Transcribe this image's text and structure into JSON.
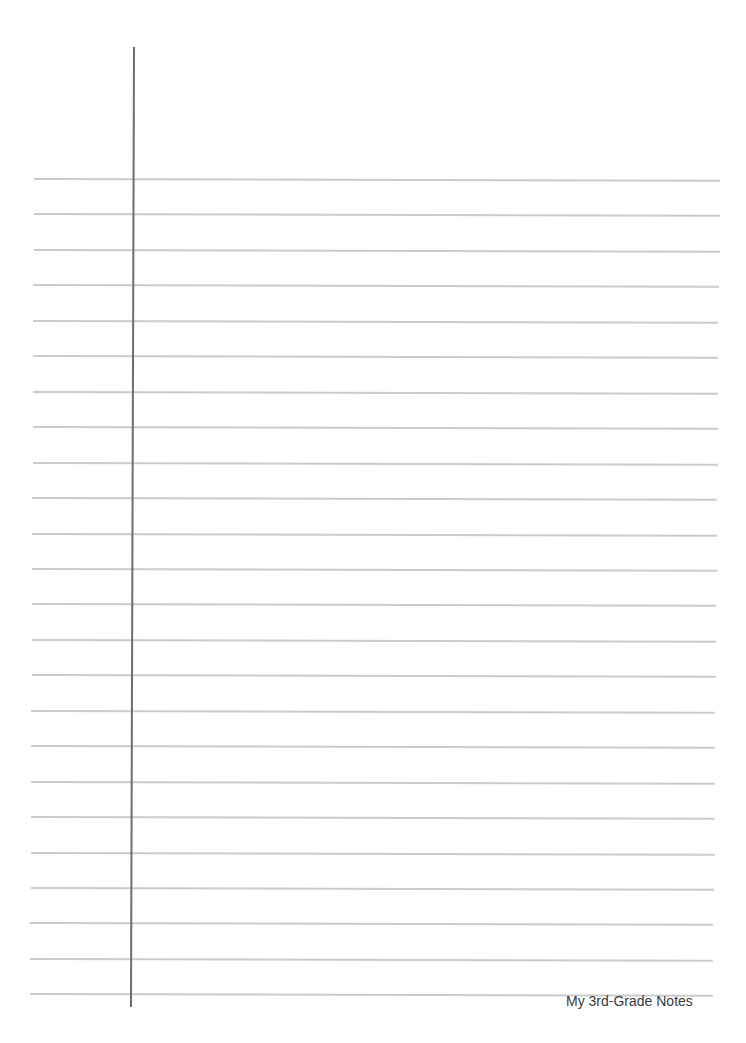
{
  "document": {
    "type": "lined-notebook-page",
    "footer_text": "My 3rd-Grade Notes",
    "line_count": 24,
    "colors": {
      "rule_line": "#cbcbcb",
      "margin_line": "#6e6e6e",
      "paper": "#ffffff",
      "footer_text": "#3a3a3a"
    }
  }
}
